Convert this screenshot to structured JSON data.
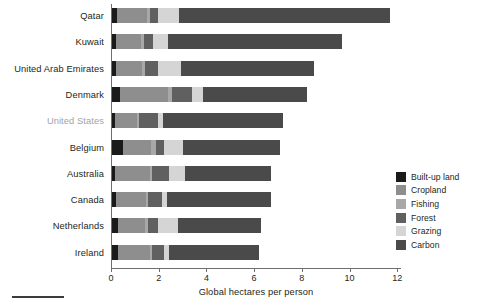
{
  "chart_data": {
    "type": "bar",
    "orientation": "horizontal",
    "stacked": true,
    "title": "",
    "xlabel": "Global hectares per person",
    "ylabel": "",
    "xlim": [
      0,
      12.6
    ],
    "xticks": [
      0,
      2,
      4,
      6,
      8,
      10,
      12
    ],
    "xtick_labels": [
      "0",
      "2",
      "4",
      "6",
      "8",
      "10",
      "12"
    ],
    "grid": false,
    "legend_position": "right",
    "categories": [
      "Qatar",
      "Kuwait",
      "United Arab Emirates",
      "Denmark",
      "United States",
      "Belgium",
      "Australia",
      "Canada",
      "Netherlands",
      "Ireland"
    ],
    "highlighted_category": "United States",
    "series": [
      {
        "name": "Built-up land",
        "color": "#1a1a1a",
        "values": [
          0.25,
          0.22,
          0.22,
          0.38,
          0.18,
          0.52,
          0.18,
          0.2,
          0.28,
          0.28
        ]
      },
      {
        "name": "Cropland",
        "color": "#8e8e8e",
        "values": [
          1.25,
          1.05,
          1.1,
          2.0,
          0.9,
          1.15,
          1.45,
          1.25,
          1.15,
          1.35
        ]
      },
      {
        "name": "Fishing",
        "color": "#a8a8a8",
        "values": [
          0.12,
          0.12,
          0.1,
          0.18,
          0.1,
          0.2,
          0.1,
          0.1,
          0.12,
          0.1
        ]
      },
      {
        "name": "Forest",
        "color": "#606060",
        "values": [
          0.35,
          0.38,
          0.55,
          0.85,
          0.78,
          0.35,
          0.7,
          0.6,
          0.42,
          0.5
        ]
      },
      {
        "name": "Grazing",
        "color": "#d5d5d5",
        "values": [
          0.9,
          0.62,
          0.95,
          0.45,
          0.2,
          0.78,
          0.68,
          0.2,
          0.83,
          0.2
        ]
      },
      {
        "name": "Carbon",
        "color": "#4a4a4a",
        "values": [
          8.83,
          7.31,
          5.58,
          4.34,
          5.04,
          4.1,
          3.59,
          4.35,
          3.5,
          3.77
        ]
      }
    ],
    "totals": [
      11.7,
      9.7,
      8.5,
      8.2,
      7.2,
      7.1,
      6.7,
      6.7,
      6.3,
      6.2
    ]
  },
  "legend": {
    "items": [
      {
        "label": "Built-up land",
        "color": "#1a1a1a"
      },
      {
        "label": "Cropland",
        "color": "#8e8e8e"
      },
      {
        "label": "Fishing",
        "color": "#a8a8a8"
      },
      {
        "label": "Forest",
        "color": "#606060"
      },
      {
        "label": "Grazing",
        "color": "#d5d5d5"
      },
      {
        "label": "Carbon",
        "color": "#4a4a4a"
      }
    ]
  },
  "axis": {
    "x_title": "Global hectares per person"
  }
}
